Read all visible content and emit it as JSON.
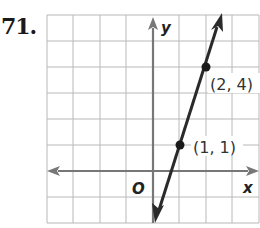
{
  "problem": {
    "number": "71."
  },
  "graph": {
    "x_axis_label": "x",
    "y_axis_label": "y",
    "origin_label": "O",
    "points": [
      {
        "label": "(1, 1)",
        "x": 1,
        "y": 1
      },
      {
        "label": "(2, 4)",
        "x": 2,
        "y": 4
      }
    ],
    "line": {
      "slope": 3,
      "intercept": -2,
      "equation": "y = 3x - 2"
    },
    "grid": {
      "x_range": [
        -4,
        4
      ],
      "y_range": [
        -2,
        6
      ],
      "unit": 1
    },
    "colors": {
      "grid": "#b8b8b8",
      "axis": "#777777",
      "line": "#2a2a2a"
    }
  }
}
